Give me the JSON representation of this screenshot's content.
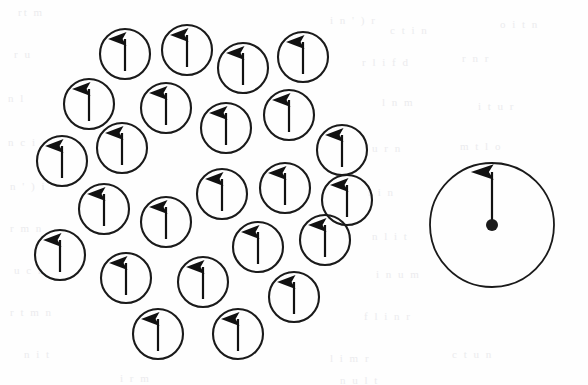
{
  "figure": {
    "background_color": "#fefefe",
    "stroke_color": "#1a1a1a",
    "arrow_color": "#111111",
    "canvas": {
      "width": 588,
      "height": 385
    }
  },
  "cluster": {
    "label": "spin-cluster",
    "count": 24,
    "circle_radius": 25,
    "arrow_length": 34,
    "arrow_direction": "up",
    "circles": [
      {
        "id": 1,
        "cx": 125,
        "cy": 54,
        "r": 25,
        "arrow": "up"
      },
      {
        "id": 2,
        "cx": 187,
        "cy": 50,
        "r": 25,
        "arrow": "up"
      },
      {
        "id": 3,
        "cx": 243,
        "cy": 68,
        "r": 25,
        "arrow": "up"
      },
      {
        "id": 4,
        "cx": 303,
        "cy": 57,
        "r": 25,
        "arrow": "up"
      },
      {
        "id": 5,
        "cx": 89,
        "cy": 104,
        "r": 25,
        "arrow": "up"
      },
      {
        "id": 6,
        "cx": 166,
        "cy": 108,
        "r": 25,
        "arrow": "up"
      },
      {
        "id": 7,
        "cx": 226,
        "cy": 128,
        "r": 25,
        "arrow": "up"
      },
      {
        "id": 8,
        "cx": 289,
        "cy": 115,
        "r": 25,
        "arrow": "up"
      },
      {
        "id": 9,
        "cx": 62,
        "cy": 161,
        "r": 25,
        "arrow": "up"
      },
      {
        "id": 10,
        "cx": 122,
        "cy": 148,
        "r": 25,
        "arrow": "up"
      },
      {
        "id": 11,
        "cx": 342,
        "cy": 150,
        "r": 25,
        "arrow": "up"
      },
      {
        "id": 12,
        "cx": 222,
        "cy": 194,
        "r": 25,
        "arrow": "up"
      },
      {
        "id": 13,
        "cx": 285,
        "cy": 188,
        "r": 25,
        "arrow": "up"
      },
      {
        "id": 14,
        "cx": 104,
        "cy": 209,
        "r": 25,
        "arrow": "up"
      },
      {
        "id": 15,
        "cx": 166,
        "cy": 222,
        "r": 25,
        "arrow": "up"
      },
      {
        "id": 16,
        "cx": 60,
        "cy": 255,
        "r": 25,
        "arrow": "up"
      },
      {
        "id": 17,
        "cx": 258,
        "cy": 247,
        "r": 25,
        "arrow": "up"
      },
      {
        "id": 18,
        "cx": 325,
        "cy": 240,
        "r": 25,
        "arrow": "up"
      },
      {
        "id": 19,
        "cx": 126,
        "cy": 278,
        "r": 25,
        "arrow": "up"
      },
      {
        "id": 20,
        "cx": 203,
        "cy": 282,
        "r": 25,
        "arrow": "up"
      },
      {
        "id": 21,
        "cx": 294,
        "cy": 297,
        "r": 25,
        "arrow": "up"
      },
      {
        "id": 22,
        "cx": 158,
        "cy": 334,
        "r": 25,
        "arrow": "up"
      },
      {
        "id": 23,
        "cx": 238,
        "cy": 334,
        "r": 25,
        "arrow": "up"
      },
      {
        "id": 24,
        "cx": 347,
        "cy": 200,
        "r": 25,
        "arrow": "up"
      }
    ]
  },
  "magnified_spin": {
    "label": "magnified-spin",
    "cx": 492,
    "cy": 225,
    "r": 62,
    "dot_radius": 6,
    "arrow": {
      "direction": "up",
      "tip_y": 168,
      "tail_y": 225
    }
  },
  "background_text": {
    "note": "faint scanned bleed-through from reverse page",
    "lines": [
      {
        "text": "rt   m",
        "x": 18,
        "y": 6
      },
      {
        "text": "i n   ' ) r",
        "x": 330,
        "y": 14
      },
      {
        "text": "c t i  n",
        "x": 390,
        "y": 24
      },
      {
        "text": "o  i  t   n",
        "x": 500,
        "y": 18
      },
      {
        "text": "r u",
        "x": 14,
        "y": 48
      },
      {
        "text": "r  l i f  d",
        "x": 362,
        "y": 56
      },
      {
        "text": "r  n   r",
        "x": 462,
        "y": 52
      },
      {
        "text": "n  l",
        "x": 8,
        "y": 92
      },
      {
        "text": "l  n  m",
        "x": 382,
        "y": 96
      },
      {
        "text": "i  t  u   r",
        "x": 478,
        "y": 100
      },
      {
        "text": "n  c  i",
        "x": 8,
        "y": 136
      },
      {
        "text": "u  r  n",
        "x": 372,
        "y": 142
      },
      {
        "text": "m  t   l   o",
        "x": 460,
        "y": 140
      },
      {
        "text": "n  ' ) i",
        "x": 10,
        "y": 180
      },
      {
        "text": "t   i n",
        "x": 368,
        "y": 186
      },
      {
        "text": "r   m  n",
        "x": 10,
        "y": 222
      },
      {
        "text": "n  l  i  t",
        "x": 372,
        "y": 230
      },
      {
        "text": "u  c  r",
        "x": 14,
        "y": 264
      },
      {
        "text": "i  n   u  m",
        "x": 376,
        "y": 268
      },
      {
        "text": "r t  m  n",
        "x": 10,
        "y": 306
      },
      {
        "text": "f  l  i   n  r",
        "x": 364,
        "y": 310
      },
      {
        "text": "n  i  t",
        "x": 24,
        "y": 348
      },
      {
        "text": "l  i  m   r",
        "x": 330,
        "y": 352
      },
      {
        "text": "c  t  u  n",
        "x": 452,
        "y": 348
      },
      {
        "text": "i   r  m",
        "x": 120,
        "y": 372
      },
      {
        "text": "n  u  l  t",
        "x": 340,
        "y": 374
      }
    ]
  }
}
